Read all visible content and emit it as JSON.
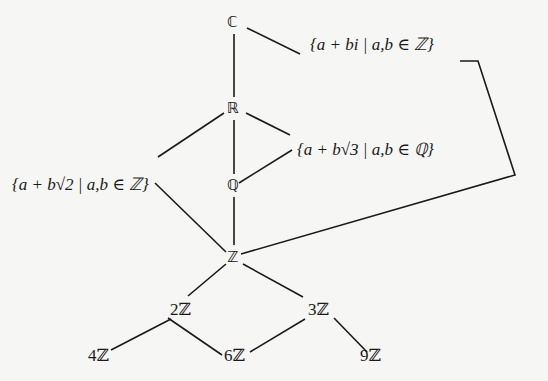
{
  "diagram": {
    "type": "subring lattice",
    "nodes": {
      "C": "ℂ",
      "R": "ℝ",
      "Q": "ℚ",
      "Z": "ℤ",
      "gauss": "{a + bi | a,b ∈ ℤ}",
      "sqrt2": "{a + b√2 | a,b ∈ ℤ}",
      "sqrt3": "{a + b√3 | a,b ∈ ℚ}",
      "twoZ": "2ℤ",
      "threeZ": "3ℤ",
      "fourZ": "4ℤ",
      "sixZ": "6ℤ",
      "nineZ": "9ℤ"
    },
    "edges": [
      [
        "C",
        "R"
      ],
      [
        "C",
        "gauss"
      ],
      [
        "R",
        "Q"
      ],
      [
        "R",
        "sqrt2"
      ],
      [
        "R",
        "sqrt3"
      ],
      [
        "Q",
        "sqrt3"
      ],
      [
        "Q",
        "Z"
      ],
      [
        "sqrt2",
        "Z"
      ],
      [
        "gauss",
        "Z"
      ],
      [
        "Z",
        "twoZ"
      ],
      [
        "Z",
        "threeZ"
      ],
      [
        "twoZ",
        "fourZ"
      ],
      [
        "twoZ",
        "sixZ"
      ],
      [
        "threeZ",
        "sixZ"
      ],
      [
        "threeZ",
        "nineZ"
      ]
    ]
  }
}
